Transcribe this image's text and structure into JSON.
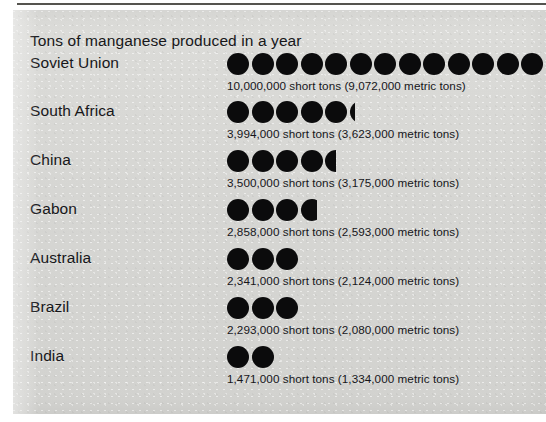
{
  "chart_data": {
    "type": "bar",
    "subtype": "pictograph",
    "title": "Tons of manganese produced in a year",
    "xlabel": "",
    "ylabel": "",
    "grid": false,
    "legend": "none",
    "unit_short": "short tons",
    "unit_metric": "metric tons",
    "icon": "filled-circle",
    "icon_value_short_tons": 769000,
    "categories": [
      "Soviet Union",
      "South Africa",
      "China",
      "Gabon",
      "Australia",
      "Brazil",
      "India"
    ],
    "values": [
      10000000,
      3994000,
      3500000,
      2858000,
      2341000,
      2293000,
      1471000
    ],
    "values_metric": [
      9072000,
      3623000,
      3175000,
      2593000,
      2124000,
      2080000,
      1334000
    ],
    "icon_counts": [
      13,
      5.25,
      4.5,
      3.75,
      3,
      3,
      2
    ],
    "rows": [
      {
        "country": "Soviet Union",
        "full_icons": 13,
        "partial_fraction": 0,
        "value_text": "10,000,000 short tons (9,072,000 metric tons)"
      },
      {
        "country": "South Africa",
        "full_icons": 5,
        "partial_fraction": 0.25,
        "value_text": "3,994,000 short tons (3,623,000 metric tons)"
      },
      {
        "country": "China",
        "full_icons": 4,
        "partial_fraction": 0.5,
        "value_text": "3,500,000 short tons (3,175,000 metric tons)"
      },
      {
        "country": "Gabon",
        "full_icons": 3,
        "partial_fraction": 0.75,
        "value_text": "2,858,000 short tons (2,593,000 metric tons)"
      },
      {
        "country": "Australia",
        "full_icons": 3,
        "partial_fraction": 0,
        "value_text": "2,341,000 short tons (2,124,000 metric tons)"
      },
      {
        "country": "Brazil",
        "full_icons": 3,
        "partial_fraction": 0,
        "value_text": "2,293,000 short tons (2,080,000 metric tons)"
      },
      {
        "country": "India",
        "full_icons": 2,
        "partial_fraction": 0,
        "value_text": "1,471,000 short tons (1,334,000 metric tons)"
      }
    ]
  },
  "colors": {
    "icon": "#0b0b0c",
    "text": "#17171a",
    "paper": "#d9d9d6",
    "rule": "#55544f"
  }
}
